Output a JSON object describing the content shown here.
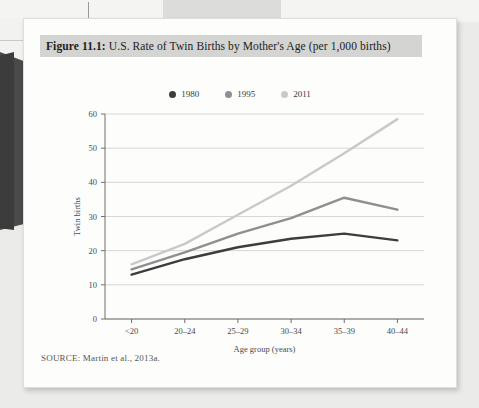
{
  "figure": {
    "label": "Figure 11.1:",
    "title": "U.S. Rate of Twin Births by Mother's Age (per 1,000 births)",
    "source": "SOURCE: Martin et al., 2013a."
  },
  "colors": {
    "series_1980": "#3d3d3d",
    "series_1995": "#8f8f8f",
    "series_2011": "#c9c9c9",
    "grid": "#d7d7d5",
    "axis": "#6e6e6e",
    "title_band": "#d4d4d2",
    "card": "#fdfdfc"
  },
  "chart_data": {
    "type": "line",
    "title": "U.S. Rate of Twin Births by Mother's Age (per 1,000 births)",
    "xlabel": "Age group (years)",
    "ylabel": "Twin births",
    "categories": [
      "<20",
      "20–24",
      "25–29",
      "30–34",
      "35–39",
      "40–44"
    ],
    "ylim": [
      0,
      60
    ],
    "yticks": [
      0,
      10,
      20,
      30,
      40,
      50,
      60
    ],
    "grid": true,
    "legend_position": "top-center",
    "series": [
      {
        "name": "1980",
        "color": "#3d3d3d",
        "values": [
          13,
          17.5,
          21,
          23.5,
          25,
          23
        ]
      },
      {
        "name": "1995",
        "color": "#8f8f8f",
        "values": [
          14.5,
          19.5,
          25,
          29.5,
          35.5,
          32
        ]
      },
      {
        "name": "2011",
        "color": "#c9c9c9",
        "values": [
          16,
          22,
          30.5,
          39,
          48.5,
          58.5
        ]
      }
    ]
  }
}
